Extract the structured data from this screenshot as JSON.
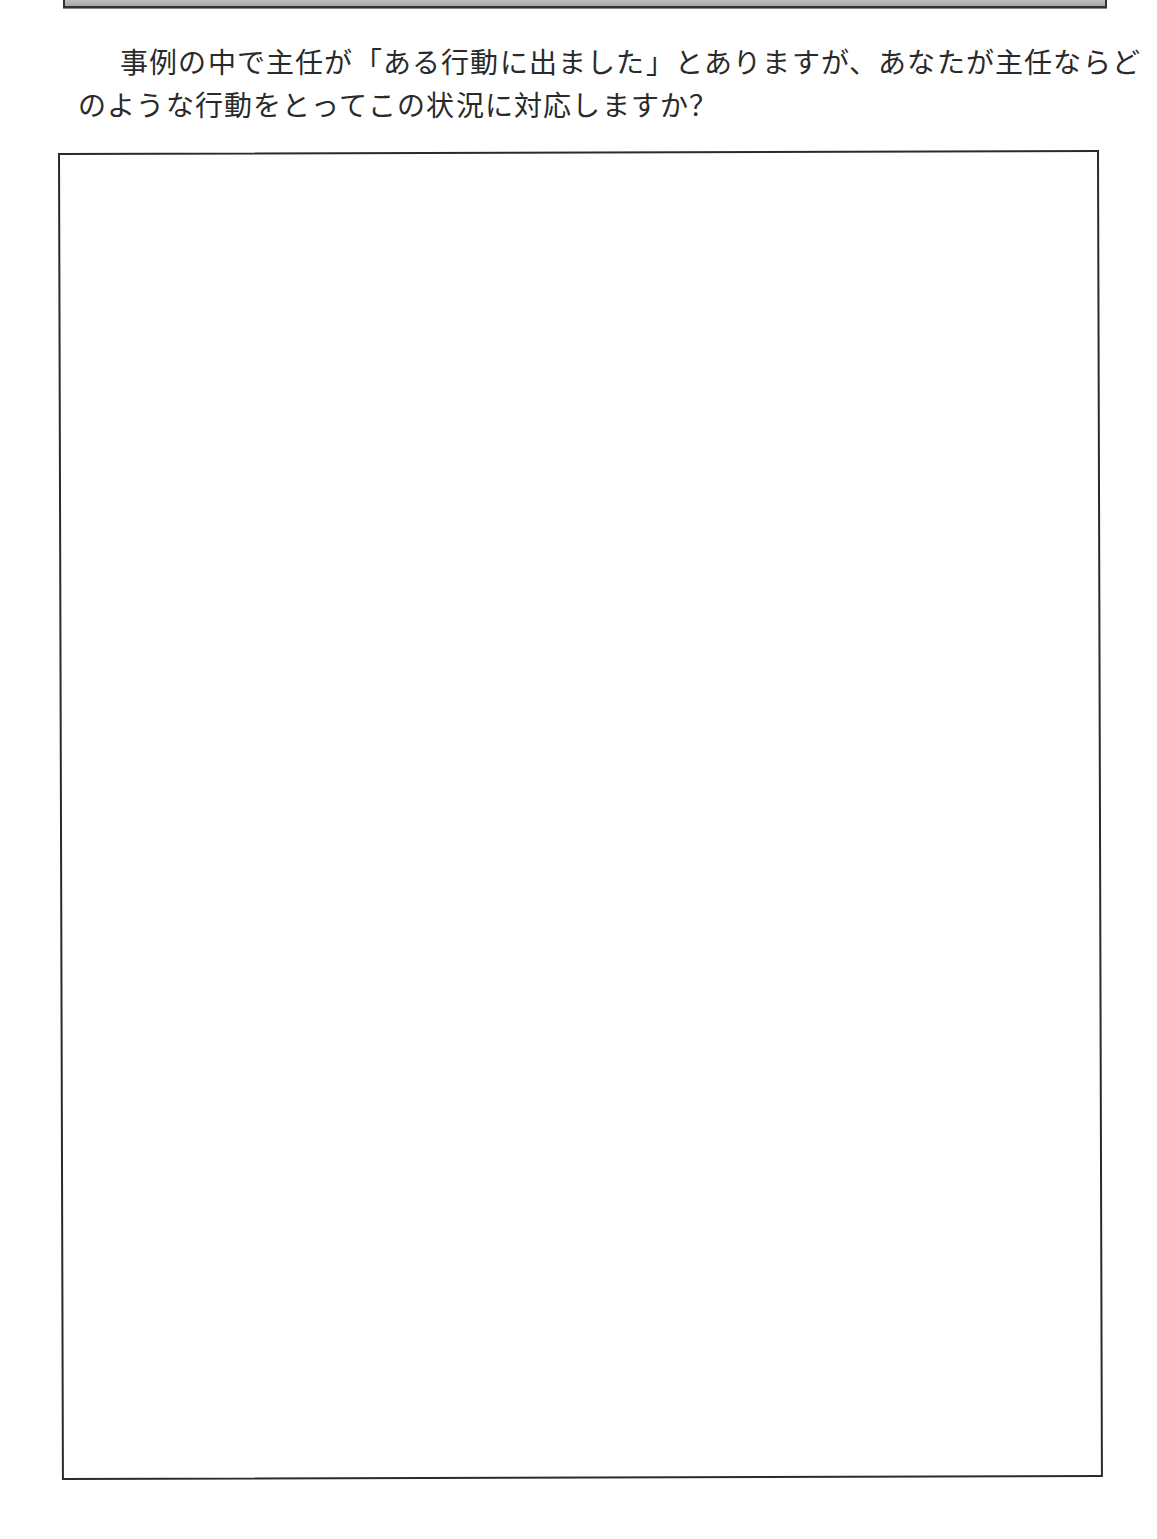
{
  "header_bar": {
    "description": "gray header panel (cropped)"
  },
  "question": {
    "line1": "事例の中で主任が「ある行動に出ました」とありますが、あなたが主任ならど",
    "line2": "のような行動をとってこの状況に対応しますか？"
  },
  "answer_box": {
    "value": "",
    "placeholder": ""
  },
  "colors": {
    "border": "#2b2b2b",
    "text": "#2a2a2a",
    "header_gradient_top": "#e6e6e6",
    "header_gradient_bottom": "#a8a8a8"
  }
}
